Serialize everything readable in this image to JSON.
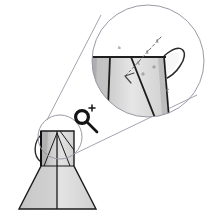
{
  "canvas": {
    "width": 208,
    "height": 220,
    "background": "#ffffff",
    "title": "Jug model with zoom detail callout"
  },
  "colors": {
    "outline": "#1a1a1a",
    "outline_soft": "#3a3a3a",
    "circle_stroke": "#8c8c9a",
    "leader_stroke": "#8c8c9a",
    "fill_light": "#e8e8e8",
    "fill_mid": "#d2d2d2",
    "fill_dark": "#b4b4b4",
    "fill_darkest": "#9a9a9a",
    "annotation": "#555555",
    "icon": "#141414",
    "background": "#ffffff"
  },
  "source_object": {
    "name": "jug-model-small",
    "label": "",
    "geometry": {
      "neck_rect": {
        "x": 41,
        "y": 131,
        "width": 33,
        "height": 35
      },
      "body_trapezoid": {
        "top_left_x": 41,
        "top_right_x": 74,
        "bottom_left_x": 19,
        "bottom_right_x": 96,
        "top_y": 166,
        "bottom_y": 209
      },
      "center_line_x": 57,
      "handle_side": "left"
    }
  },
  "detail_marker": {
    "name": "detail-region-circle",
    "center_x": 60,
    "center_y": 137,
    "radius": 22
  },
  "magnified_view": {
    "name": "zoom-detail-circle",
    "center_x": 148,
    "center_y": 61,
    "radius": 56,
    "contents_label": "",
    "shows": "jug neck, rim and handle at high magnification"
  },
  "leader_lines": {
    "name": "callout-leaders",
    "upper": {
      "x1": 47,
      "y1": 120,
      "x2": 103,
      "y2": 16
    },
    "lower": {
      "x1": 71,
      "y1": 156,
      "x2": 196,
      "y2": 96
    }
  },
  "annotation_arrow": {
    "name": "dashed-measurement-arrow",
    "style": "dashed",
    "direction": "down-left",
    "start": {
      "x": 160,
      "y": 38
    },
    "end": {
      "x": 126,
      "y": 76
    },
    "tick_marks": 4
  },
  "zoom_icon": {
    "name": "magnifier-plus-icon",
    "glyph": "+",
    "center_x": 84,
    "center_y": 119,
    "lens_radius": 7,
    "tooltip": "Zoom in"
  },
  "legend": {
    "caption": ""
  }
}
